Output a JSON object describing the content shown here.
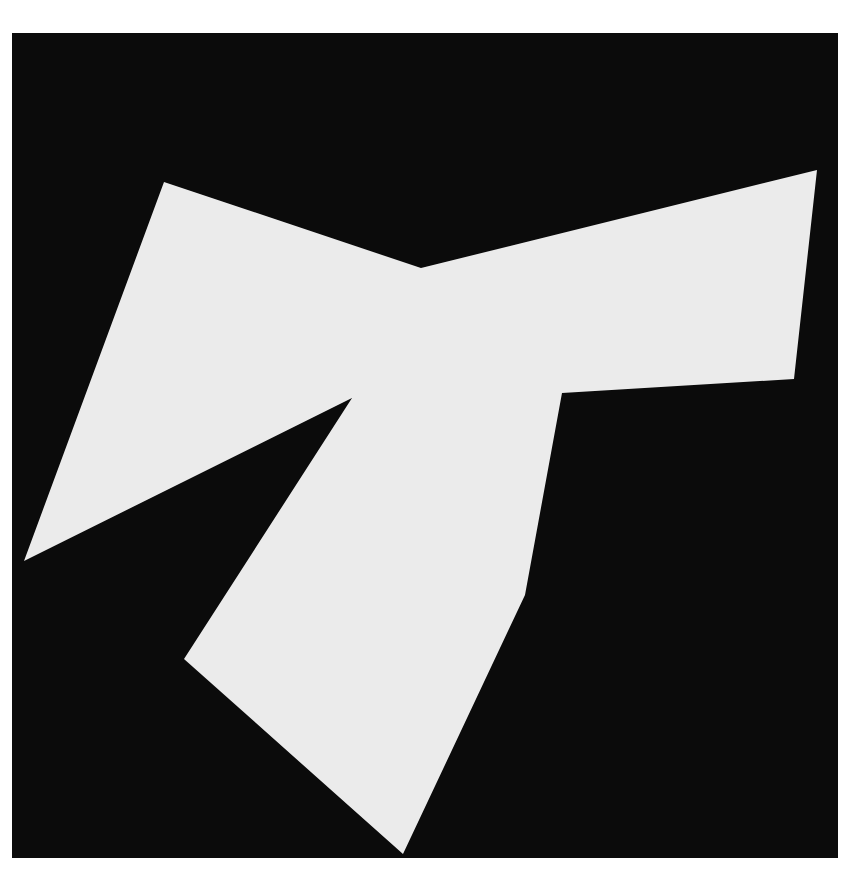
{
  "artwork": {
    "description": "White angular cut-out shape on black square background",
    "background_color": "#ffffff",
    "panel_color": "#0b0b0b",
    "shape_color": "#ebebeb",
    "panel": {
      "x": 12,
      "y": 33,
      "width": 826,
      "height": 825
    },
    "shape_points": "164,182 421,268 817,170 794,379 562,393 525,595 403,854 184,659 352,398 24,561"
  }
}
